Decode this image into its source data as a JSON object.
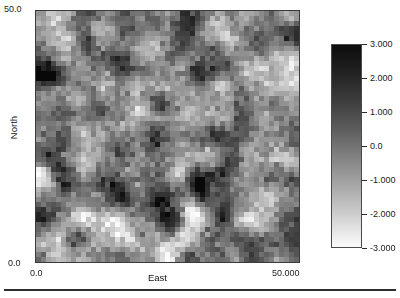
{
  "chart_data": {
    "type": "heatmap",
    "title": "",
    "subtitle": "",
    "xlabel": "East",
    "ylabel": "North",
    "xlim": [
      0.0,
      50.0
    ],
    "ylim": [
      0.0,
      50.0
    ],
    "grid": false,
    "x_tick_labels": [
      "0.0",
      "50.000"
    ],
    "y_tick_labels": [
      "0.0",
      "50.0"
    ],
    "nx": 53,
    "ny": 50,
    "colormap": "grayscale-reversed",
    "colormap_note": "dark = high value, light = low value",
    "zlim": [
      -3.0,
      3.0
    ],
    "legend_position": "right",
    "colorbar": {
      "orientation": "vertical",
      "vmin": -3.0,
      "vmax": 3.0,
      "tick_values": [
        3.0,
        2.0,
        1.0,
        0.0,
        -1.0,
        -2.0,
        -3.0
      ],
      "tick_labels": [
        "3.000",
        "2.000",
        "1.000",
        "0.0",
        "-1.000",
        "-2.000",
        "-3.000"
      ],
      "high_color": "#0d0d0d",
      "low_color": "#fafafa"
    },
    "field": {
      "description": "spatially-correlated Gaussian random field",
      "mean": 0.0,
      "std": 1.0,
      "correlation_range_cells": 3.2,
      "seed": 20240517
    }
  },
  "axes": {
    "y_top_label": "50.0",
    "y_bottom_label": "0.0",
    "x_left_label": "0.0",
    "x_right_label": "50.000",
    "x_title": "East",
    "y_title": "North"
  },
  "colorbar_labels": [
    "3.000",
    "2.000",
    "1.000",
    "0.0",
    "-1.000",
    "-2.000",
    "-3.000"
  ],
  "colors": {
    "axis_text": "#1a1a1a",
    "plot_border": "#3a3a3a",
    "colorbar_border": "#4a4a4a",
    "page_background": "#ffffff",
    "rule": "#2e2e2e"
  }
}
